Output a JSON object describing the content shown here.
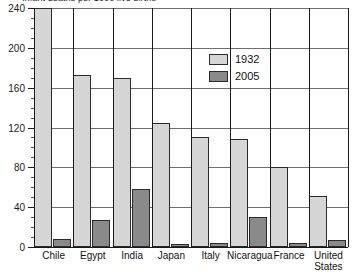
{
  "chart_data": {
    "type": "bar",
    "title": "Infant deaths per 1000 live births",
    "xlabel": "",
    "ylabel": "",
    "ylim": [
      0,
      240
    ],
    "ytick_step": 40,
    "yminor_step": 10,
    "grid": true,
    "legend_position": "top-right",
    "categories": [
      "Chile",
      "Egypt",
      "India",
      "Japan",
      "Italy",
      "Nicaragua",
      "France",
      "United\nStates"
    ],
    "series": [
      {
        "name": "1932",
        "color": "#d6d6d6",
        "values": [
          240,
          173,
          170,
          125,
          110,
          108,
          80,
          51
        ]
      },
      {
        "name": "2005",
        "color": "#8a8a8a",
        "values": [
          8,
          27,
          58,
          3,
          4,
          30,
          4,
          7
        ]
      }
    ],
    "ytick_labels": [
      "240",
      "200",
      "160",
      "120",
      "80",
      "40",
      "0"
    ],
    "ytick_values": [
      240,
      200,
      160,
      120,
      80,
      40,
      0
    ]
  },
  "legend": {
    "items": [
      {
        "label": "1932"
      },
      {
        "label": "2005"
      }
    ]
  }
}
